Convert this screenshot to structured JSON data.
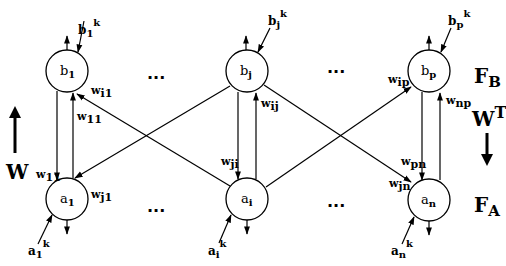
{
  "diagram": {
    "type": "bidirectional associative memory network",
    "layers": {
      "top": {
        "label": "F",
        "label_sub": "B",
        "nodes": [
          {
            "id": "b1",
            "name": "b",
            "sub": "1",
            "input": {
              "name": "b",
              "sub": "1",
              "sup": "k"
            }
          },
          {
            "id": "bj",
            "name": "b",
            "sub": "j",
            "input": {
              "name": "b",
              "sub": "j",
              "sup": "k"
            }
          },
          {
            "id": "bp",
            "name": "b",
            "sub": "p",
            "input": {
              "name": "b",
              "sub": "p",
              "sup": "k"
            }
          }
        ]
      },
      "bottom": {
        "label": "F",
        "label_sub": "A",
        "nodes": [
          {
            "id": "a1",
            "name": "a",
            "sub": "1",
            "input": {
              "name": "a",
              "sub": "1",
              "sup": "k"
            }
          },
          {
            "id": "ai",
            "name": "a",
            "sub": "i",
            "input": {
              "name": "a",
              "sub": "i",
              "sup": "k"
            }
          },
          {
            "id": "an",
            "name": "a",
            "sub": "n",
            "input": {
              "name": "a",
              "sub": "n",
              "sup": "k"
            }
          }
        ]
      }
    },
    "ellipsis": "...",
    "direction_labels": {
      "up": {
        "text": "W",
        "sup": ""
      },
      "down": {
        "text": "W",
        "sup": "T"
      }
    },
    "weights": [
      {
        "from": "a1",
        "to": "b1",
        "w": "w",
        "sub": "11"
      },
      {
        "from": "b1",
        "to": "a1",
        "w": "w",
        "sub": "11"
      },
      {
        "from": "ai",
        "to": "b1",
        "w": "w",
        "sub": "i1"
      },
      {
        "from": "bj",
        "to": "a1",
        "w": "w",
        "sub": "j1"
      },
      {
        "from": "ai",
        "to": "bj",
        "w": "w",
        "sub": "ij"
      },
      {
        "from": "bj",
        "to": "ai",
        "w": "w",
        "sub": "ji"
      },
      {
        "from": "ai",
        "to": "bp",
        "w": "w",
        "sub": "ip"
      },
      {
        "from": "an",
        "to": "bp",
        "w": "w",
        "sub": "np"
      },
      {
        "from": "bp",
        "to": "an",
        "w": "w",
        "sub": "pn"
      },
      {
        "from": "bj",
        "to": "an",
        "w": "w",
        "sub": "jn"
      }
    ]
  }
}
